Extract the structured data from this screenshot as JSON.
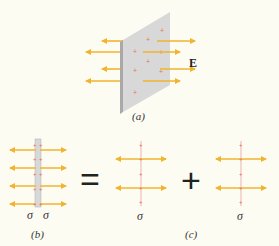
{
  "figure": {
    "panel_a": {
      "label": "(a)",
      "field_label": "E"
    },
    "panel_b": {
      "label": "(b)",
      "sigma_left": "σ",
      "sigma_right": "σ"
    },
    "panel_c": {
      "label": "(c)",
      "sigma_1": "σ",
      "sigma_2": "σ"
    },
    "equals_symbol": "=",
    "plus_symbol": "+"
  },
  "colors": {
    "arrow": "#f1b42f",
    "charge": "#e8735a",
    "plate": "#d6d6d6",
    "plate_edge": "#a9a9a9",
    "background": "#fdfcf3"
  }
}
